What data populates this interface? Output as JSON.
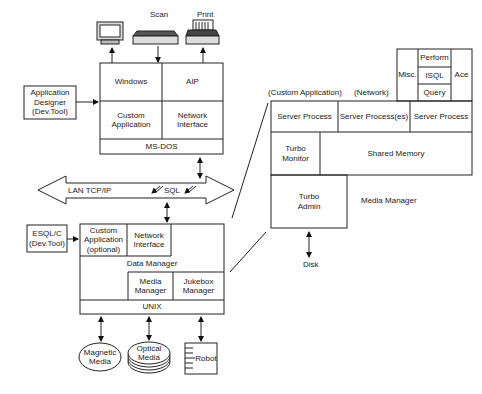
{
  "diagram": {
    "type": "system-architecture",
    "client": {
      "devices": {
        "monitor": "",
        "scan": "Scan",
        "print": "Print"
      },
      "cells": {
        "windows": "Windows",
        "aip": "AIP",
        "custom_app": "Custom\nApplication",
        "network_if": "Network\nInterface",
        "os": "MS-DOS"
      },
      "dev_tool": "Application\nDesigner\n(Dev.Tool)"
    },
    "network": {
      "lan": "LAN TCP/IP",
      "sql": "SQL"
    },
    "server": {
      "dev_tool": "ESQL/C\n(Dev.Tool)",
      "cells": {
        "custom_app": "Custom\nApplication\n(optional)",
        "network_if": "Network\nInterface",
        "data_manager": "Data Manager",
        "media_manager": "Media\nManager",
        "jukebox_manager": "Jukebox\nManager",
        "os": "UNIX"
      },
      "storage": {
        "magnetic": "Magnetic\nMedia",
        "optical": "Optical\nMedia",
        "robot": "Robot"
      }
    },
    "detail": {
      "header_labels": {
        "custom_app": "(Custom Application)",
        "network": "(Network)"
      },
      "tools": {
        "misc": "Misc.",
        "perform": "Perform",
        "isql": "ISQL",
        "query": "Query",
        "ace": "Ace"
      },
      "processes": [
        "Server Process",
        "Server Process(es)",
        "Server Process"
      ],
      "turbo_monitor": "Turbo\nMonitor",
      "shared_memory": "Shared Memory",
      "turbo_admin": "Turbo\nAdmin",
      "media_manager": "Media Manager",
      "disk": "Disk"
    }
  }
}
